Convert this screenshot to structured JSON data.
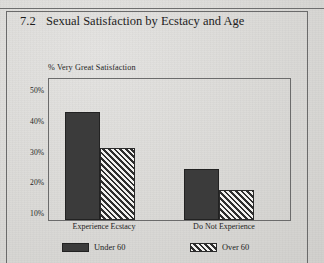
{
  "figure": {
    "caption_number": "7.2",
    "caption_text": "Sexual Satisfaction by Ecstacy and Age"
  },
  "chart_data": {
    "type": "bar",
    "title": "Sexual Satisfaction by Ecstacy and Age",
    "xlabel": "",
    "ylabel": "% Very Great Satisfaction",
    "categories": [
      "Experience Ecstacy",
      "Do Not Experience"
    ],
    "series": [
      {
        "name": "Under 60",
        "values": [
          42,
          23
        ],
        "fill": "solid",
        "color": "#3b3b3b"
      },
      {
        "name": "Over 60",
        "values": [
          30,
          16
        ],
        "fill": "hatch",
        "color": "#2e2e2e"
      }
    ],
    "ylim": [
      6,
      53
    ],
    "yticks": [
      "10%",
      "20%",
      "30%",
      "40%",
      "50%"
    ],
    "ytick_values": [
      10,
      20,
      30,
      40,
      50
    ],
    "grid": false,
    "legend_position": "bottom"
  },
  "axis": {
    "y_title": "% Very Great Satisfaction",
    "tick_50": "50%",
    "tick_40": "40%",
    "tick_30": "30%",
    "tick_20": "20%",
    "tick_10": "10%"
  },
  "categories": {
    "cat_0": "Experience Ecstacy",
    "cat_1": "Do Not Experience"
  },
  "legend": {
    "item_0": "Under 60",
    "item_1": "Over 60"
  }
}
